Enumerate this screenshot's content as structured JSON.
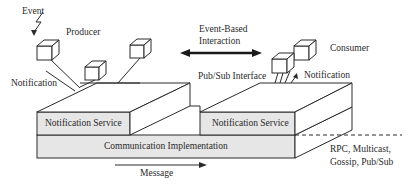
{
  "labels": {
    "event": "Event",
    "producer": "Producer",
    "notification_left": "Notification",
    "event_based_1": "Event-Based",
    "event_based_2": "Interaction",
    "consumer": "Consumer",
    "pubsub_interface": "Pub/Sub Interface",
    "notification_right": "Notification",
    "notification_service_left": "Notification  Service",
    "notification_service_right": "Notification  Service",
    "communication_implementation": "Communication Implementation",
    "message": "Message",
    "protocols_1": "RPC, Multicast,",
    "protocols_2": "Gossip, Pub/Sub"
  },
  "colors": {
    "stroke": "#2a2a2a",
    "box_fill": "#e6e6e6",
    "background": "#ffffff"
  }
}
